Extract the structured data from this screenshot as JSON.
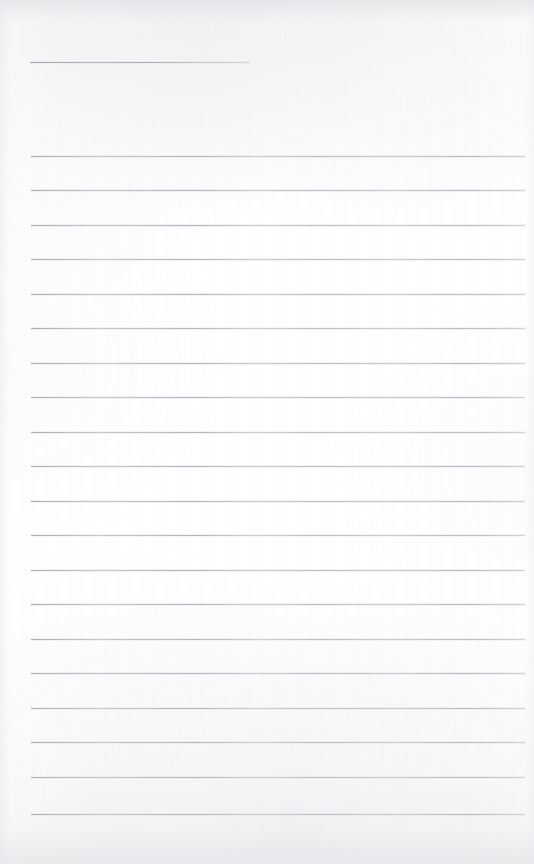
{
  "document": {
    "kind": "scanned-lined-page",
    "title": "",
    "page_width": 534,
    "page_height": 864,
    "background_color": "#fdfdfd",
    "rule_color": "#c9c9cf",
    "body_text": "",
    "visible_text": ""
  },
  "layout": {
    "left_margin": 31,
    "right_margin": 9,
    "content_left": 31,
    "content_right": 525
  },
  "header_rule": {
    "name": "header-rule",
    "y": 62,
    "x": 30,
    "width": 220,
    "label": ""
  },
  "ruled_lines": [
    {
      "index": 1,
      "y": 156,
      "x": 31,
      "width": 494
    },
    {
      "index": 2,
      "y": 190,
      "x": 31,
      "width": 494
    },
    {
      "index": 3,
      "y": 225,
      "x": 31,
      "width": 494
    },
    {
      "index": 4,
      "y": 259,
      "x": 31,
      "width": 494
    },
    {
      "index": 5,
      "y": 294,
      "x": 31,
      "width": 494
    },
    {
      "index": 6,
      "y": 328,
      "x": 31,
      "width": 494
    },
    {
      "index": 7,
      "y": 363,
      "x": 31,
      "width": 494
    },
    {
      "index": 8,
      "y": 397,
      "x": 31,
      "width": 494
    },
    {
      "index": 9,
      "y": 432,
      "x": 31,
      "width": 494
    },
    {
      "index": 10,
      "y": 466,
      "x": 31,
      "width": 494
    },
    {
      "index": 11,
      "y": 501,
      "x": 31,
      "width": 494
    },
    {
      "index": 12,
      "y": 535,
      "x": 31,
      "width": 494
    },
    {
      "index": 13,
      "y": 570,
      "x": 31,
      "width": 494
    },
    {
      "index": 14,
      "y": 604,
      "x": 31,
      "width": 494
    },
    {
      "index": 15,
      "y": 639,
      "x": 31,
      "width": 494
    },
    {
      "index": 16,
      "y": 673,
      "x": 31,
      "width": 494
    },
    {
      "index": 17,
      "y": 708,
      "x": 31,
      "width": 494
    },
    {
      "index": 18,
      "y": 742,
      "x": 31,
      "width": 494
    },
    {
      "index": 19,
      "y": 777,
      "x": 31,
      "width": 494
    },
    {
      "index": 20,
      "y": 814,
      "x": 31,
      "width": 494
    }
  ]
}
